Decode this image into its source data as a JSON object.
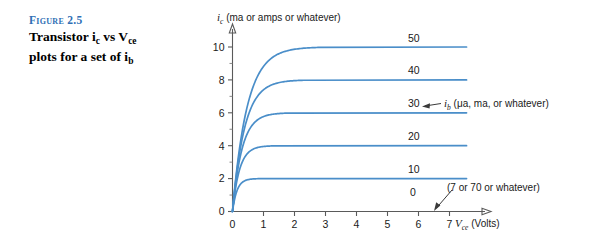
{
  "figure": {
    "number_label": "Figure 2.5",
    "caption_line1_pre": "Transistor i",
    "caption_line1_sub1": "c",
    "caption_line1_mid": " vs V",
    "caption_line1_sub2": "ce",
    "caption_line2_pre": "plots for a set of i",
    "caption_line2_sub": "b",
    "accent_color": "#2f6fb5"
  },
  "chart_data": {
    "type": "line",
    "title": "",
    "curve_color": "#4a8ec9",
    "xlabel_var": "V",
    "xlabel_sub": "ce",
    "xlabel_unit": "(Volts)",
    "ylabel_var": "i",
    "ylabel_sub": "c",
    "ylabel_unit": "(ma or amps or whatever)",
    "xlim": [
      0,
      7.6
    ],
    "ylim": [
      0,
      11.2
    ],
    "xticks": [
      0,
      1,
      2,
      3,
      4,
      5,
      6,
      7
    ],
    "xticklabels": [
      "0",
      "1",
      "2",
      "3",
      "4",
      "5",
      "6",
      "7"
    ],
    "yticks": [
      0,
      2,
      4,
      6,
      8,
      10
    ],
    "yticklabels": [
      "0",
      "2",
      "4",
      "6",
      "8",
      "10"
    ],
    "yminor": [
      1,
      3,
      5,
      7,
      9
    ],
    "grid": false,
    "legend_position": "inline-right-of-curve",
    "series": [
      {
        "name": "10",
        "saturation": 2,
        "knee_x": 0.45,
        "label": "10"
      },
      {
        "name": "20",
        "saturation": 4,
        "knee_x": 0.7,
        "label": "20"
      },
      {
        "name": "30",
        "saturation": 6,
        "knee_x": 0.95,
        "label": "30"
      },
      {
        "name": "40",
        "saturation": 8,
        "knee_x": 1.2,
        "label": "40"
      },
      {
        "name": "50",
        "saturation": 10,
        "knee_x": 1.45,
        "label": "50"
      }
    ],
    "baseline_label": "0",
    "annotations": [
      {
        "name": "ib-annotation",
        "var": "i",
        "sub": "b",
        "text": "(μa, ma, or whatever)",
        "points_to": "30"
      },
      {
        "name": "vce-max-annotation",
        "text": "(7 or 70 or whatever)",
        "points_to": "7"
      }
    ]
  }
}
